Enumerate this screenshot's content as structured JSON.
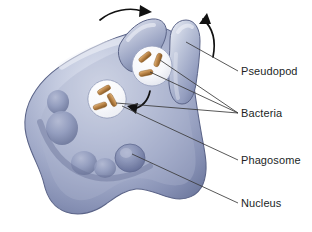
{
  "figure": {
    "background_color": "#ffffff"
  },
  "colors": {
    "cell_light": "#cdd3e4",
    "cell_mid": "#9aa4c4",
    "cell_dark": "#6f7aa3",
    "cell_shadow": "#5d6690",
    "cell_outline": "#5b6488",
    "vesicle_fill": "#f4f5f9",
    "vesicle_outline": "#7d86a8",
    "bacteria_fill": "#c08a4a",
    "bacteria_dark": "#96632b",
    "bacteria_light": "#e0b87e",
    "arrow_color": "#111111",
    "leader_color": "#3a3a3a",
    "label_text": "#221f1f"
  },
  "labels": [
    {
      "id": "pseudopod",
      "text": "Pseudopod",
      "dash": "—"
    },
    {
      "id": "bacteria",
      "text": "Bacteria",
      "dash": "—"
    },
    {
      "id": "phagosome",
      "text": "Phagosome",
      "dash": "—"
    },
    {
      "id": "nucleus",
      "text": "Nucleus",
      "dash": "—"
    }
  ],
  "structures": {
    "cell": {
      "name": "phagocyte-cell-body",
      "description": "Amoeboid phagocytic cell with lobed margin and extended pseudopods"
    },
    "pseudopods": [
      {
        "name": "pseudopod-left",
        "description": "Upper-left finger-like extension"
      },
      {
        "name": "pseudopod-right",
        "description": "Upper-right finger-like extension"
      }
    ],
    "phagosome": {
      "name": "phagosome-vesicle",
      "bacteria_count": 3,
      "description": "Internalized vesicle containing bacteria"
    },
    "engulfment_pocket": {
      "name": "engulfment-vesicle",
      "bacteria_count": 3,
      "description": "Forming vesicle between pseudopods holding bacteria"
    },
    "nucleus": {
      "name": "nucleus",
      "description": "Lobed nucleus in lower region of cytoplasm"
    }
  },
  "arrows": [
    {
      "id": "arrow-pseudopod-left",
      "direction": "clockwise-right",
      "description": "Curved arrow over left pseudopod indicating it sweeps right"
    },
    {
      "id": "arrow-pseudopod-right",
      "direction": "counterclockwise-up",
      "description": "Curved arrow over right pseudopod indicating it sweeps up and left"
    },
    {
      "id": "arrow-internalization",
      "direction": "left",
      "description": "Curved arrow inside cytoplasm showing vesicle moving inward"
    }
  ]
}
